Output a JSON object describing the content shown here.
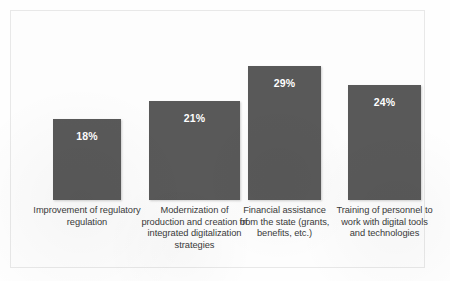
{
  "chart_data": {
    "type": "bar",
    "title": "",
    "subtitle": "",
    "xlabel": "",
    "ylabel": "",
    "grid": false,
    "legend": false,
    "ylim": [
      0,
      35
    ],
    "categories": [
      "Improvement of regulatory regulation",
      "Modernization of production and creation of integrated digitalization strategies",
      "Financial assistance from the state (grants, benefits, etc.)",
      "Training of personnel to work with digital tools and technologies"
    ],
    "values": [
      18,
      21,
      29,
      24
    ],
    "value_labels": [
      "18%",
      "21%",
      "29%",
      "24%"
    ],
    "bar_color": "#595959",
    "value_label_color": "#ffffff",
    "category_label_color": "#3a3a3a",
    "background_color": "#fdfdfd",
    "series": [
      {
        "name": "Share of respondents",
        "values": [
          18,
          21,
          29,
          24
        ]
      }
    ]
  },
  "bars": [
    {
      "label": "Improvement of regulatory regulation",
      "value_label": "18%",
      "value": 18
    },
    {
      "label": "Modernization of production and creation of integrated digitalization strategies",
      "value_label": "21%",
      "value": 21
    },
    {
      "label": "Financial assistance from the state (grants, benefits, etc.)",
      "value_label": "29%",
      "value": 29
    },
    {
      "label": "Training of personnel to work with digital tools and technologies",
      "value_label": "24%",
      "value": 24
    }
  ]
}
